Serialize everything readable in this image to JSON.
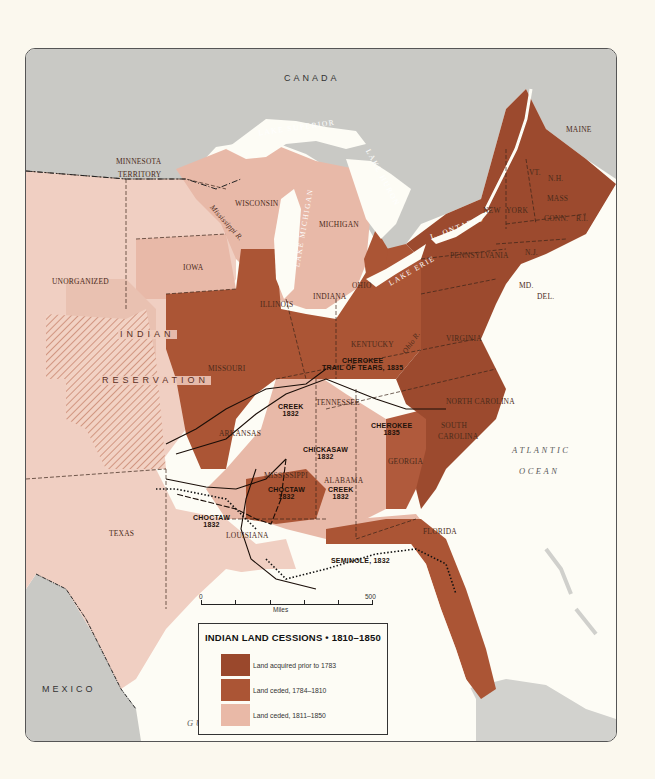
{
  "map": {
    "title": "INDIAN LAND CESSIONS • 1810–1850",
    "colors": {
      "page_background": "#fbf8ee",
      "water": "#fdfcf5",
      "foreign_land": "#c9c9c5",
      "prior_1783": "#9c4a2e",
      "ceded_1784_1810": "#a9543a",
      "ceded_1811_1850": "#e8b9a8",
      "unceded_territory": "#f0cfc2",
      "border": "#3a2418"
    },
    "countries": {
      "canada": "CANADA",
      "mexico": "MEXICO"
    },
    "water_bodies": {
      "lake_superior": "LAKE SUPERIOR",
      "lake_michigan": "LAKE MICHIGAN",
      "lake_huron": "LAKE HURON",
      "lake_erie": "LAKE ERIE",
      "lake_ontario": "L. ONTARIO",
      "atlantic_1": "ATLANTIC",
      "atlantic_2": "OCEAN",
      "gulf": "GULF OF MEXICO"
    },
    "rivers": {
      "mississippi": "Mississippi R.",
      "ohio": "Ohio R."
    },
    "states": {
      "maine": "MAINE",
      "vt": "VT.",
      "nh": "N.H.",
      "mass": "MASS",
      "conn": "CONN.",
      "ri": "R.I.",
      "new_york_1": "NEW",
      "new_york_2": "YORK",
      "pennsylvania": "PENNSYLVANIA",
      "nj": "N.J.",
      "md": "MD.",
      "del": "DEL.",
      "virginia": "VIRGINIA",
      "north_carolina": "NORTH CAROLINA",
      "south_carolina_1": "SOUTH",
      "south_carolina_2": "CAROLINA",
      "georgia": "GEORGIA",
      "florida": "FLORIDA",
      "alabama": "ALABAMA",
      "mississippi": "MISSISSIPPI",
      "louisiana": "LOUISIANA",
      "tennessee": "TENNESSEE",
      "kentucky": "KENTUCKY",
      "ohio": "OHIO",
      "indiana": "INDIANA",
      "illinois": "ILLINOIS",
      "michigan": "MICHIGAN",
      "wisconsin": "WISCONSIN",
      "iowa": "IOWA",
      "missouri": "MISSOURI",
      "arkansas": "ARKANSAS",
      "texas": "TEXAS",
      "minnesota_1": "MINNESOTA",
      "minnesota_2": "TERRITORY",
      "unorganized": "UNORGANIZED",
      "indian_reservation_1": "INDIAN",
      "indian_reservation_2": "RESERVATION"
    },
    "removal_routes": [
      {
        "line1": "CHEROKEE",
        "line2": "TRAIL OF TEARS, 1835"
      },
      {
        "line1": "CREEK",
        "line2": "1832"
      },
      {
        "line1": "CHEROKEE",
        "line2": "1835"
      },
      {
        "line1": "CHICKASAW",
        "line2": "1832"
      },
      {
        "line1": "CHOCTAW",
        "line2": "1832"
      },
      {
        "line1": "CREEK",
        "line2": "1832"
      },
      {
        "line1": "CHOCTAW",
        "line2": "1832"
      },
      {
        "line1": "SEMINOLE, 1832",
        "line2": ""
      }
    ],
    "scale": {
      "start": "0",
      "end": "500",
      "unit": "Miles"
    },
    "legend": {
      "title": "INDIAN LAND CESSIONS • 1810–1850",
      "items": [
        {
          "label": "Land acquired prior to 1783",
          "color": "#9a482c"
        },
        {
          "label": "Land ceded, 1784–1810",
          "color": "#ab5535"
        },
        {
          "label": "Land ceded, 1811–1850",
          "color": "#e9b9a7"
        }
      ]
    }
  }
}
